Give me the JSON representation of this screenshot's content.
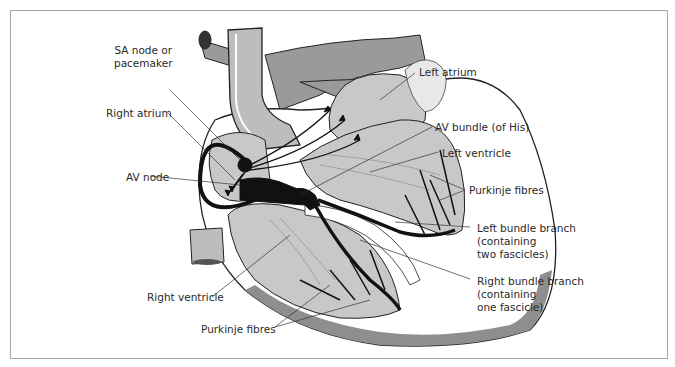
{
  "figure": {
    "labels": {
      "sa_node": [
        "SA node or",
        "pacemaker"
      ],
      "right_atrium": "Right atrium",
      "av_node": "AV node",
      "right_ventricle": "Right ventricle",
      "purkinje_bottom": "Purkinje fibres",
      "left_atrium": "Left atrium",
      "av_bundle": "AV bundle (of His)",
      "left_ventricle": "Left ventricle",
      "purkinje_right": "Purkinje fibres",
      "left_bundle_branch": [
        "Left bundle branch",
        "(containing",
        "two fascicles)"
      ],
      "right_bundle_branch": [
        "Right bundle branch",
        "(containing",
        "one fascicle)"
      ]
    },
    "colors": {
      "tissue": "#c8c8c8",
      "vessel": "#9a9a9a",
      "conduction": "#111111",
      "outline": "#222222",
      "frame": "#a8a8a8"
    }
  }
}
